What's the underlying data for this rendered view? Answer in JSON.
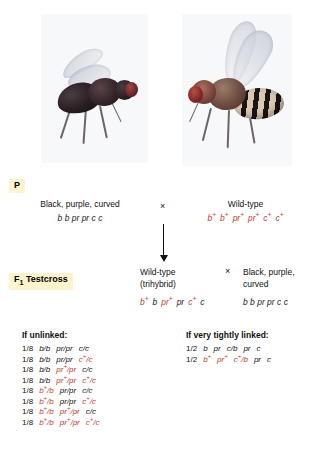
{
  "figure": {
    "top_artifact_text": "",
    "accent_red": "#c0392b",
    "chip_highlight": "#fdf3cd",
    "cross_symbol": "×"
  },
  "photos": [
    {
      "name": "black-purple-curved-fly-photo",
      "alt_label": "Black, purple, curved mutant fruit fly"
    },
    {
      "name": "wild-type-fly-photo",
      "alt_label": "Wild-type fruit fly"
    }
  ],
  "p_generation": {
    "chip_label": "P",
    "left": {
      "phenotype": "Black, purple, curved",
      "genotype_plain": "b b pr pr c c"
    },
    "cross_symbol": "×",
    "right": {
      "phenotype": "Wild-type",
      "genotype_parts": [
        {
          "gene": "b",
          "plus": true
        },
        {
          "gene": "b",
          "plus": true
        },
        {
          "gene": "pr",
          "plus": true
        },
        {
          "gene": "pr",
          "plus": true
        },
        {
          "gene": "c",
          "plus": true
        },
        {
          "gene": "c",
          "plus": true
        }
      ]
    }
  },
  "f1_testcross": {
    "chip_label_main": "F",
    "chip_label_sub": "1",
    "chip_label_rest": " Testcross",
    "left": {
      "phenotype_line1": "Wild-type",
      "phenotype_line2": "(trihybrid)",
      "genotype_parts": [
        {
          "gene": "b",
          "plus": true,
          "red": true
        },
        {
          "gene": "b",
          "plus": false,
          "red": false
        },
        {
          "gene": "pr",
          "plus": true,
          "red": true
        },
        {
          "gene": "pr",
          "plus": false,
          "red": false
        },
        {
          "gene": "c",
          "plus": true,
          "red": true
        },
        {
          "gene": "c",
          "plus": false,
          "red": false
        }
      ]
    },
    "cross_symbol": "×",
    "right": {
      "phenotype_line1": "Black, purple,",
      "phenotype_line2": "curved",
      "genotype_plain": "b b pr pr c c"
    }
  },
  "unlinked": {
    "heading": "If unlinked:",
    "rows": [
      {
        "fraction": "1/8",
        "genotype": "b/b  pr/pr  c/c",
        "segments": [
          {
            "t": "b/b",
            "red": false
          },
          {
            "t": "pr/pr",
            "red": false
          },
          {
            "t": "c/c",
            "red": false
          }
        ]
      },
      {
        "fraction": "1/8",
        "genotype": "b/b  pr/pr  c+/c",
        "segments": [
          {
            "t": "b/b",
            "red": false
          },
          {
            "t": "pr/pr",
            "red": false
          },
          {
            "t": "c",
            "sup": "+",
            "tail": "/c",
            "red": true
          }
        ]
      },
      {
        "fraction": "1/8",
        "genotype": "b/b  pr+/pr  c/c",
        "segments": [
          {
            "t": "b/b",
            "red": false
          },
          {
            "t": "pr",
            "sup": "+",
            "tail": "/pr",
            "red": true
          },
          {
            "t": "c/c",
            "red": false
          }
        ]
      },
      {
        "fraction": "1/8",
        "genotype": "b/b  pr+/pr  c+/c",
        "segments": [
          {
            "t": "b/b",
            "red": false
          },
          {
            "t": "pr",
            "sup": "+",
            "tail": "/pr",
            "red": true
          },
          {
            "t": "c",
            "sup": "+",
            "tail": "/c",
            "red": true
          }
        ]
      },
      {
        "fraction": "1/8",
        "genotype": "b+/b  pr/pr  c/c",
        "segments": [
          {
            "t": "b",
            "sup": "+",
            "tail": "/b",
            "red": true
          },
          {
            "t": "pr/pr",
            "red": false
          },
          {
            "t": "c/c",
            "red": false
          }
        ]
      },
      {
        "fraction": "1/8",
        "genotype": "b+/b  pr/pr  c+/c",
        "segments": [
          {
            "t": "b",
            "sup": "+",
            "tail": "/b",
            "red": true
          },
          {
            "t": "pr/pr",
            "red": false
          },
          {
            "t": "c",
            "sup": "+",
            "tail": "/c",
            "red": true
          }
        ]
      },
      {
        "fraction": "1/8",
        "genotype": "b+/b  pr+/pr  c/c",
        "segments": [
          {
            "t": "b",
            "sup": "+",
            "tail": "/b",
            "red": true
          },
          {
            "t": "pr",
            "sup": "+",
            "tail": "/pr",
            "red": true
          },
          {
            "t": "c/c",
            "red": false
          }
        ]
      },
      {
        "fraction": "1/8",
        "genotype": "b+/b  pr+/pr  c+/c",
        "segments": [
          {
            "t": "b",
            "sup": "+",
            "tail": "/b",
            "red": true
          },
          {
            "t": "pr",
            "sup": "+",
            "tail": "/pr",
            "red": true
          },
          {
            "t": "c",
            "sup": "+",
            "tail": "/c",
            "red": true
          }
        ]
      }
    ]
  },
  "linked": {
    "heading": "If very tightly linked:",
    "rows": [
      {
        "fraction": "1/2",
        "genotype": "b  pr  c/b  pr  c",
        "segments": [
          {
            "t": "b",
            "red": false
          },
          {
            "t": "pr",
            "red": false
          },
          {
            "t": "c/b",
            "red": false
          },
          {
            "t": "pr",
            "red": false
          },
          {
            "t": "c",
            "red": false
          }
        ]
      },
      {
        "fraction": "1/2",
        "genotype": "b+  pr+  c+/b  pr  c",
        "segments": [
          {
            "t": "b",
            "sup": "+",
            "red": true
          },
          {
            "t": "pr",
            "sup": "+",
            "red": true
          },
          {
            "t": "c",
            "sup": "+",
            "tail": "/b",
            "red": true
          },
          {
            "t": "pr",
            "red": false
          },
          {
            "t": "c",
            "red": false
          }
        ]
      }
    ]
  }
}
